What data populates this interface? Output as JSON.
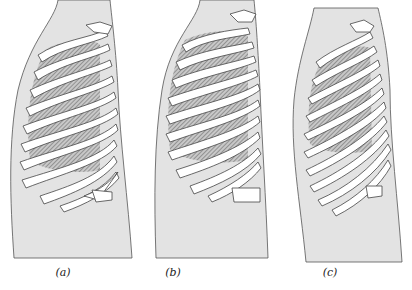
{
  "figure": {
    "panels": [
      {
        "id": "a",
        "label": "(a)",
        "description": "Rib cage lateral view, normal posture"
      },
      {
        "id": "b",
        "label": "(b)",
        "description": "Rib cage lateral view, expanded (inspiration)"
      },
      {
        "id": "c",
        "label": "(c)",
        "description": "Rib cage lateral view, narrow/elongated"
      }
    ],
    "colors": {
      "body_fill": "#e3e3e3",
      "outline": "#555555",
      "rib_fill": "#ffffff",
      "hatch": "#7a7a7a",
      "background": "#ffffff"
    }
  }
}
